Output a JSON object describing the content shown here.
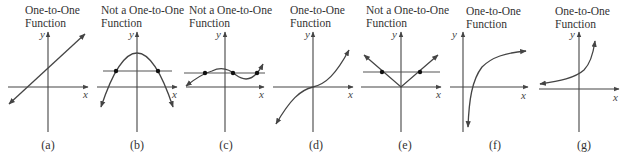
{
  "figure": {
    "panels": [
      {
        "id": "a",
        "title_line1": "One-to-One",
        "title_line2": "Function",
        "caption": "(a)",
        "is_one_to_one": true,
        "graph": "increasing straight line"
      },
      {
        "id": "b",
        "title_line1": "Not a One-to-One",
        "title_line2": "Function",
        "caption": "(b)",
        "is_one_to_one": false,
        "graph": "downward parabola cut by horizontal line at 2 points"
      },
      {
        "id": "c",
        "title_line1": "Not a One-to-One",
        "title_line2": "Function",
        "caption": "(c)",
        "is_one_to_one": false,
        "graph": "cubic wave cut by horizontal line at 3 points"
      },
      {
        "id": "d",
        "title_line1": "One-to-One",
        "title_line2": "Function",
        "caption": "(d)",
        "is_one_to_one": true,
        "graph": "cubic-like increasing curve through origin"
      },
      {
        "id": "e",
        "title_line1": "Not a One-to-One",
        "title_line2": "Function",
        "caption": "(e)",
        "is_one_to_one": false,
        "graph": "absolute value V cut by horizontal line at 2 points"
      },
      {
        "id": "f",
        "title_line1": "One-to-One",
        "title_line2": "Function",
        "caption": "(f)",
        "is_one_to_one": true,
        "graph": "logarithmic curve"
      },
      {
        "id": "g",
        "title_line1": "One-to-One",
        "title_line2": "Function",
        "caption": "(g)",
        "is_one_to_one": true,
        "graph": "exponential curve"
      }
    ],
    "axis_labels": {
      "x": "x",
      "y": "y"
    }
  }
}
